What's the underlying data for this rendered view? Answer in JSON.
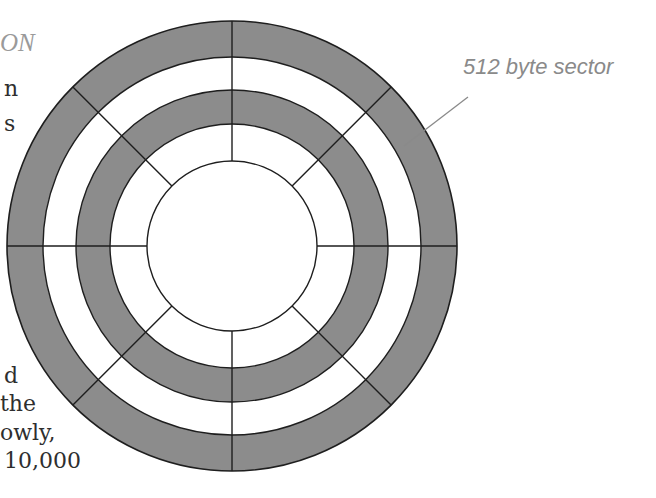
{
  "heading": {
    "text": "ON"
  },
  "body_fragments": [
    {
      "text": "n",
      "x": 4,
      "y": 78
    },
    {
      "text": "s",
      "x": 4,
      "y": 113
    },
    {
      "text": "d",
      "x": 4,
      "y": 365
    },
    {
      "text": "the",
      "x": 0,
      "y": 393
    },
    {
      "text": "owly,",
      "x": 0,
      "y": 422
    },
    {
      "text": "10,000",
      "x": 4,
      "y": 450
    }
  ],
  "annotation": {
    "label": "512 byte sector",
    "leader": {
      "x1": 468,
      "y1": 97,
      "x2": 404,
      "y2": 146
    }
  },
  "diagram": {
    "center": {
      "x": 232,
      "y": 246
    },
    "ring_radii": [
      225,
      189,
      156,
      122,
      85
    ],
    "bands": [
      {
        "name": "track-1-outer",
        "r_outer": 225,
        "r_inner": 189,
        "shaded": true
      },
      {
        "name": "gap-1",
        "r_outer": 189,
        "r_inner": 156,
        "shaded": false
      },
      {
        "name": "track-2",
        "r_outer": 156,
        "r_inner": 122,
        "shaded": true
      },
      {
        "name": "gap-2",
        "r_outer": 122,
        "r_inner": 85,
        "shaded": false
      }
    ],
    "spoke_angles_deg": [
      0,
      45,
      90,
      135,
      180,
      225,
      270,
      315
    ],
    "colors": {
      "shade": "#8c8c8c",
      "stroke": "#1e1e1e",
      "background": "#ffffff",
      "leader": "#8a8a8a"
    }
  }
}
